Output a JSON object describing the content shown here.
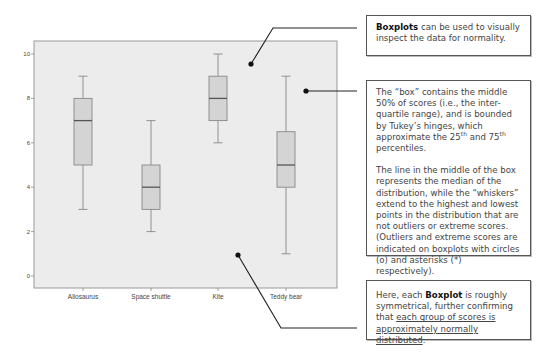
{
  "chart_data": {
    "type": "boxplot",
    "title": "",
    "xlabel": "",
    "ylabel": "",
    "ylim": [
      0,
      10
    ],
    "y_ticks": [
      0,
      2,
      4,
      6,
      8,
      10
    ],
    "grid": false,
    "categories": [
      "Allosaurus",
      "Space shuttle",
      "Kite",
      "Teddy bear"
    ],
    "series": [
      {
        "name": "Allosaurus",
        "min": 3,
        "q1": 5,
        "median": 7,
        "q3": 8,
        "max": 9
      },
      {
        "name": "Space shuttle",
        "min": 2,
        "q1": 3,
        "median": 4,
        "q3": 5,
        "max": 7
      },
      {
        "name": "Kite",
        "min": 6,
        "q1": 7,
        "median": 8,
        "q3": 9,
        "max": 10
      },
      {
        "name": "Teddy bear",
        "min": 1,
        "q1": 4,
        "median": 5,
        "q3": 6.5,
        "max": 9
      }
    ],
    "colors": {
      "plot_background": "#ececec",
      "box_fill": "#d4d4d4",
      "box_stroke": "#888888",
      "median_stroke": "#555555",
      "frame": "#9a9a9a"
    }
  },
  "callouts": {
    "normality": {
      "bold": "Boxplots",
      "text": " can be used to visually inspect the data for normality."
    },
    "box_explanation": {
      "p1_a": "The “box” contains the middle 50% of scores (i.e., the inter-quartile range), and is bounded by Tukey’s hinges, which approximate the ",
      "p1_sup1": "th",
      "p1_num1": "25",
      "p1_mid": " and ",
      "p1_num2": "75",
      "p1_sup2": "th",
      "p1_end": " percentiles.",
      "p2": "The line in the middle of the box represents the median of the distribution, while the “whiskers” extend to the highest and lowest points in the distribution that are not outliers or extreme scores. (Outliers and extreme scores are indicated on boxplots with circles (o) and asterisks (*) respectively)."
    },
    "symmetry": {
      "pre": "Here, each ",
      "bold": "Boxplot",
      "mid": " is roughly symmetrical, further confirming that ",
      "underlined": "each group of scores is approximately normally distributed",
      "end": "."
    }
  }
}
